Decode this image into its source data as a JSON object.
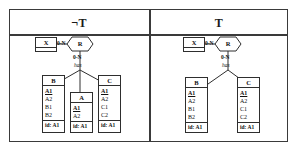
{
  "diagram": {
    "colors": {
      "stroke": "#2e2e2e",
      "frame": "#3a3a3a",
      "text": "#111111",
      "background": "#ffffff"
    },
    "panels": [
      {
        "id": "left",
        "header": "¬T",
        "entity_x": {
          "label": "X"
        },
        "relationship_r": {
          "label": "R"
        },
        "cardinality_x_r": "0-N",
        "cardinality_r_has": "0-N",
        "role_label": "has",
        "entities": [
          {
            "name": "B",
            "attributes": [
              "A1",
              "A2",
              "B1",
              "B2"
            ],
            "key_attribute": "A1",
            "identifier": "id: A1"
          },
          {
            "name": "A",
            "attributes": [
              "A1",
              "A2"
            ],
            "key_attribute": "A1",
            "identifier": "id: A1"
          },
          {
            "name": "C",
            "attributes": [
              "A1",
              "A2",
              "C1",
              "C2"
            ],
            "key_attribute": "A1",
            "identifier": "id: A1"
          }
        ]
      },
      {
        "id": "right",
        "header": "T",
        "entity_x": {
          "label": "X"
        },
        "relationship_r": {
          "label": "R"
        },
        "cardinality_x_r": "0-N",
        "cardinality_r_has": "0-N",
        "role_label": "has",
        "entities": [
          {
            "name": "B",
            "attributes": [
              "A1",
              "A2",
              "B1",
              "B2"
            ],
            "key_attribute": "A1",
            "identifier": "id: A1"
          },
          {
            "name": "C",
            "attributes": [
              "A1",
              "A2",
              "C1",
              "C2"
            ],
            "key_attribute": "A1",
            "identifier": "id: A1"
          }
        ]
      }
    ]
  }
}
